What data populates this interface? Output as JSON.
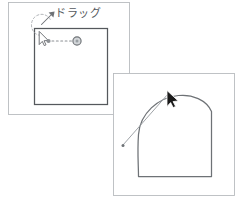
{
  "figure": {
    "annotation_text": "ドラッグ",
    "annotation_meaning": "drag",
    "background_color": "#ffffff",
    "panel_border_color": "#b9bcbf",
    "shape_border_color": "#55585c",
    "curve_color": "#6e7276",
    "cursor_color": "#1a1a1a",
    "dot_color": "#8c9094",
    "handle_color": "#8e9296",
    "dashed_color": "#a9adb1"
  },
  "panels": [
    {
      "name": "before-panel",
      "label": "Before drag",
      "x": 8,
      "y": 2,
      "width": 122,
      "height": 113,
      "inner_shape": {
        "name": "square-shape",
        "label": "Square",
        "x": 34,
        "y": 28,
        "width": 74,
        "height": 77
      }
    },
    {
      "name": "after-panel",
      "label": "After drag",
      "x": 113,
      "y": 73,
      "width": 122,
      "height": 123,
      "inner_shape": {
        "name": "bulged-shape",
        "label": "Square with bulged edge",
        "x": 138,
        "y": 95,
        "width": 73,
        "height": 82
      }
    }
  ],
  "markers": {
    "anchor_dot": {
      "name": "anchor-point",
      "label": "Anchor point"
    },
    "control_handle": {
      "name": "control-handle",
      "label": "Control handle"
    },
    "dashed_arc": {
      "name": "dashed-arc-arrow",
      "label": "Dashed rotation arrow"
    },
    "drag_vector": {
      "name": "drag-vector-line",
      "label": "Drag direction line"
    },
    "cursor_small": {
      "name": "cursor-arrow-icon",
      "label": "Mouse cursor (outline)"
    },
    "cursor_large": {
      "name": "cursor-arrow-icon",
      "label": "Mouse cursor (filled)"
    }
  },
  "annotation": {
    "text": "ドラッグ",
    "x": 55,
    "y": 9
  }
}
